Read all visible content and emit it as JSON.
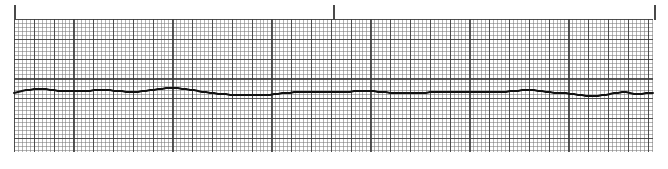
{
  "strip": {
    "name": "ecg-rhythm-strip",
    "width": 668,
    "height": 169,
    "background_color": "#ffffff"
  },
  "grid": {
    "name": "ecg-grid-paper",
    "left": 14,
    "top": 19,
    "width": 639,
    "height": 133,
    "minor_spacing_px": 3.96,
    "major_spacing_px": 19.8,
    "minor_color": "#787878",
    "major_color": "#3c3c3c",
    "paper_color": "#ffffff"
  },
  "ticks": {
    "name": "time-marker-ticks",
    "color": "#4a4a4a",
    "top": 5,
    "height": 15,
    "width": 2,
    "positions_px": [
      14,
      333,
      654
    ]
  },
  "trace": {
    "name": "ecg-waveform-trace",
    "color": "#121212",
    "stroke_width": 1.9,
    "baseline_y": 92,
    "points": [
      [
        14,
        93
      ],
      [
        18,
        92
      ],
      [
        22,
        91
      ],
      [
        26,
        90
      ],
      [
        30,
        90
      ],
      [
        34,
        89
      ],
      [
        38,
        89
      ],
      [
        42,
        89
      ],
      [
        46,
        89
      ],
      [
        50,
        90
      ],
      [
        54,
        90
      ],
      [
        58,
        91
      ],
      [
        62,
        91
      ],
      [
        66,
        91
      ],
      [
        70,
        91
      ],
      [
        74,
        91
      ],
      [
        78,
        91
      ],
      [
        82,
        91
      ],
      [
        86,
        91
      ],
      [
        90,
        91
      ],
      [
        94,
        90
      ],
      [
        98,
        90
      ],
      [
        102,
        90
      ],
      [
        106,
        90
      ],
      [
        110,
        90
      ],
      [
        114,
        91
      ],
      [
        118,
        91
      ],
      [
        122,
        91
      ],
      [
        126,
        92
      ],
      [
        130,
        92
      ],
      [
        134,
        92
      ],
      [
        138,
        92
      ],
      [
        142,
        91
      ],
      [
        146,
        91
      ],
      [
        150,
        90
      ],
      [
        154,
        90
      ],
      [
        158,
        89
      ],
      [
        162,
        89
      ],
      [
        166,
        88
      ],
      [
        170,
        88
      ],
      [
        174,
        88
      ],
      [
        178,
        88
      ],
      [
        182,
        89
      ],
      [
        186,
        89
      ],
      [
        190,
        90
      ],
      [
        194,
        90
      ],
      [
        198,
        91
      ],
      [
        202,
        92
      ],
      [
        206,
        92
      ],
      [
        210,
        93
      ],
      [
        214,
        93
      ],
      [
        218,
        94
      ],
      [
        222,
        94
      ],
      [
        226,
        94
      ],
      [
        230,
        95
      ],
      [
        234,
        95
      ],
      [
        238,
        95
      ],
      [
        242,
        95
      ],
      [
        246,
        95
      ],
      [
        250,
        95
      ],
      [
        254,
        95
      ],
      [
        258,
        95
      ],
      [
        262,
        95
      ],
      [
        266,
        95
      ],
      [
        270,
        95
      ],
      [
        274,
        94
      ],
      [
        278,
        94
      ],
      [
        282,
        93
      ],
      [
        286,
        93
      ],
      [
        290,
        93
      ],
      [
        294,
        92
      ],
      [
        298,
        92
      ],
      [
        302,
        92
      ],
      [
        306,
        92
      ],
      [
        310,
        92
      ],
      [
        314,
        92
      ],
      [
        318,
        92
      ],
      [
        322,
        92
      ],
      [
        326,
        92
      ],
      [
        330,
        92
      ],
      [
        334,
        92
      ],
      [
        338,
        92
      ],
      [
        342,
        92
      ],
      [
        346,
        92
      ],
      [
        350,
        92
      ],
      [
        354,
        91
      ],
      [
        358,
        91
      ],
      [
        362,
        91
      ],
      [
        366,
        91
      ],
      [
        370,
        91
      ],
      [
        374,
        91
      ],
      [
        378,
        92
      ],
      [
        382,
        92
      ],
      [
        386,
        92
      ],
      [
        390,
        93
      ],
      [
        394,
        93
      ],
      [
        398,
        93
      ],
      [
        402,
        93
      ],
      [
        406,
        93
      ],
      [
        410,
        93
      ],
      [
        414,
        93
      ],
      [
        418,
        93
      ],
      [
        422,
        93
      ],
      [
        426,
        93
      ],
      [
        430,
        92
      ],
      [
        434,
        92
      ],
      [
        438,
        92
      ],
      [
        442,
        92
      ],
      [
        446,
        92
      ],
      [
        450,
        92
      ],
      [
        454,
        92
      ],
      [
        458,
        92
      ],
      [
        462,
        92
      ],
      [
        466,
        92
      ],
      [
        470,
        92
      ],
      [
        474,
        92
      ],
      [
        478,
        92
      ],
      [
        482,
        92
      ],
      [
        486,
        92
      ],
      [
        490,
        92
      ],
      [
        494,
        92
      ],
      [
        498,
        92
      ],
      [
        502,
        92
      ],
      [
        506,
        92
      ],
      [
        510,
        91
      ],
      [
        514,
        91
      ],
      [
        518,
        91
      ],
      [
        522,
        90
      ],
      [
        526,
        90
      ],
      [
        530,
        90
      ],
      [
        534,
        90
      ],
      [
        538,
        91
      ],
      [
        542,
        91
      ],
      [
        546,
        92
      ],
      [
        550,
        92
      ],
      [
        554,
        93
      ],
      [
        558,
        93
      ],
      [
        562,
        93
      ],
      [
        566,
        93
      ],
      [
        570,
        94
      ],
      [
        574,
        94
      ],
      [
        578,
        95
      ],
      [
        582,
        95
      ],
      [
        586,
        96
      ],
      [
        590,
        96
      ],
      [
        594,
        96
      ],
      [
        598,
        96
      ],
      [
        602,
        95
      ],
      [
        606,
        95
      ],
      [
        610,
        94
      ],
      [
        614,
        93
      ],
      [
        618,
        93
      ],
      [
        622,
        92
      ],
      [
        626,
        92
      ],
      [
        630,
        93
      ],
      [
        634,
        94
      ],
      [
        638,
        94
      ],
      [
        642,
        94
      ],
      [
        646,
        93
      ],
      [
        650,
        93
      ],
      [
        653,
        93
      ]
    ]
  }
}
